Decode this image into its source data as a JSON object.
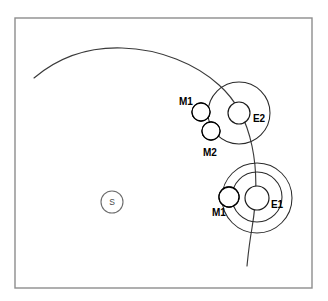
{
  "figure": {
    "kind": "orbital-mechanics-diagram",
    "background_color": "#ffffff",
    "frame": {
      "x": 15,
      "y": 18,
      "width": 297,
      "height": 270,
      "stroke_color": "#8d8d8d"
    }
  },
  "star": {
    "label": "S",
    "cx": 112,
    "cy": 202,
    "r": 11,
    "stroke_color": "#6b6b6b"
  },
  "systems": [
    {
      "id": "E2",
      "label": "E2",
      "label_x": 253,
      "label_y": 122,
      "planet": {
        "cx": 239,
        "cy": 113,
        "r": 11
      },
      "orbit_circles": [
        {
          "cx": 239,
          "cy": 113,
          "r": 31
        }
      ],
      "moons": [
        {
          "label": "M1",
          "cx": 201,
          "cy": 112,
          "r": 9,
          "shadow_side": "right",
          "label_x": 179,
          "label_y": 105
        },
        {
          "label": "M2",
          "cx": 211,
          "cy": 131,
          "r": 9,
          "shadow_side": "right",
          "label_x": 203,
          "label_y": 156
        }
      ]
    },
    {
      "id": "E1",
      "label": "E1",
      "label_x": 271,
      "label_y": 208,
      "planet": {
        "cx": 257,
        "cy": 198,
        "r": 12
      },
      "orbit_circles": [
        {
          "cx": 257,
          "cy": 198,
          "r": 35
        },
        {
          "cx": 257,
          "cy": 197,
          "r": 25
        }
      ],
      "moons": [
        {
          "label": "M1",
          "cx": 229,
          "cy": 197,
          "r": 10,
          "shadow_side": "right",
          "label_x": 212,
          "label_y": 216
        }
      ]
    }
  ],
  "trajectory": {
    "name": "transfer-trajectory",
    "stroke_color": "#3a3a3a",
    "path": "M 34,78 C 60,56 90,47 122,48 C 160,49 196,64 219,85 C 236,100 247,122 252,146 C 258,174 256,204 252,228 C 249,245 248,256 247,266"
  },
  "colors": {
    "ink": "#1a1a1a",
    "frame": "#8d8d8d",
    "shadow": "#000000",
    "paper": "#ffffff"
  }
}
